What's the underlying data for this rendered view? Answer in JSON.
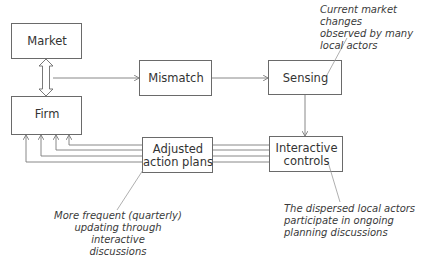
{
  "diagram": {
    "nodes": {
      "market": {
        "label": "Market"
      },
      "firm": {
        "label": "Firm"
      },
      "mismatch": {
        "label": "Mismatch"
      },
      "sensing": {
        "label": "Sensing"
      },
      "adjusted": {
        "label": "Adjusted action plans",
        "line1": "Adjusted",
        "line2": "action plans"
      },
      "interactive": {
        "label": "Interactive controls",
        "line1": "Interactive",
        "line2": "controls"
      }
    },
    "annotations": {
      "sensing_note": {
        "line1": "Current market changes",
        "line2": "observed by many",
        "line3": "local actors"
      },
      "adjusted_note": {
        "line1": "More frequent (quarterly)",
        "line2": "updating through interactive",
        "line3": "discussions"
      },
      "interactive_note": {
        "line1": "The dispersed local actors",
        "line2": "participate in ongoing",
        "line3": "planning discussions"
      }
    },
    "edges": [
      {
        "from": "market",
        "to": "firm",
        "type": "double-arrow"
      },
      {
        "from": "market-firm",
        "to": "mismatch",
        "type": "arrow"
      },
      {
        "from": "mismatch",
        "to": "sensing",
        "type": "arrow"
      },
      {
        "from": "sensing",
        "to": "interactive",
        "type": "arrow"
      },
      {
        "from": "interactive",
        "to": "firm",
        "type": "multi-arrow",
        "count": 4,
        "via": "adjusted"
      }
    ],
    "colors": {
      "stroke": "#6a6a6a",
      "text": "#333333",
      "background": "#ffffff"
    }
  }
}
